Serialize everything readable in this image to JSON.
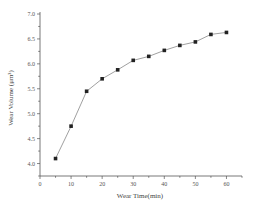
{
  "chart_data": {
    "type": "line",
    "title": "",
    "xlabel": "Wear Time(min)",
    "ylabel": "Wear Volume (μm³)",
    "xlim": [
      0,
      65
    ],
    "ylim": [
      3.75,
      7.0
    ],
    "xticks": [
      0,
      10,
      20,
      30,
      40,
      50,
      60
    ],
    "yticks": [
      4.0,
      4.5,
      5.0,
      5.5,
      6.0,
      6.5,
      7.0
    ],
    "ytick_labels": [
      "4.0",
      "4.5",
      "5.0",
      "5.5",
      "6.0",
      "6.5",
      "7.0"
    ],
    "grid": false,
    "legend": null,
    "marker": "square",
    "colors": {
      "line": "#888888",
      "marker": "#222222",
      "axis": "#555555"
    },
    "series": [
      {
        "name": "Wear Volume",
        "x": [
          5,
          10,
          15,
          20,
          25,
          30,
          35,
          40,
          45,
          50,
          55,
          60
        ],
        "values": [
          4.1,
          4.75,
          5.45,
          5.7,
          5.88,
          6.07,
          6.15,
          6.27,
          6.37,
          6.44,
          6.59,
          6.63
        ]
      }
    ]
  }
}
